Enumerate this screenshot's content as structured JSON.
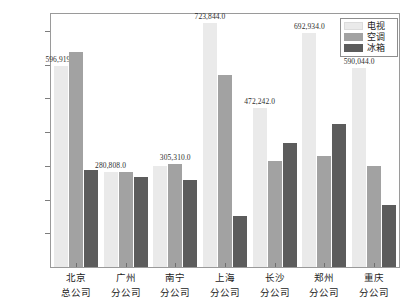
{
  "chart_data": {
    "type": "bar",
    "title": "",
    "subtitle": "",
    "xlabel": "",
    "ylabel": "",
    "ylim": [
      0,
      750000
    ],
    "ytick_values": [
      0,
      100000,
      200000,
      300000,
      400000,
      500000,
      600000,
      700000
    ],
    "ytick_labels": [
      "0",
      "100 000",
      "200 000",
      "300 000",
      "400 000",
      "500 000",
      "600 000",
      "700 000"
    ],
    "grid": false,
    "legend_position": "top-right",
    "categories": [
      "北京\n总公司",
      "广州\n分公司",
      "南宁\n分公司",
      "上海\n分公司",
      "长沙\n分公司",
      "郑州\n分公司",
      "重庆\n分公司"
    ],
    "category_lines": [
      [
        "北京",
        "总公司"
      ],
      [
        "广州",
        "分公司"
      ],
      [
        "南宁",
        "分公司"
      ],
      [
        "上海",
        "分公司"
      ],
      [
        "长沙",
        "分公司"
      ],
      [
        "郑州",
        "分公司"
      ],
      [
        "重庆",
        "分公司"
      ]
    ],
    "series": [
      {
        "name": "电视",
        "color": "#eaeaea",
        "values": [
          596919,
          280808,
          298000,
          723844,
          472242,
          692934,
          590044
        ]
      },
      {
        "name": "空调",
        "color": "#a2a2a2",
        "values": [
          637000,
          282000,
          305310,
          570000,
          314000,
          330000,
          298000
        ]
      },
      {
        "name": "冰箱",
        "color": "#5c5c5c",
        "values": [
          288000,
          268000,
          257000,
          152000,
          367000,
          424000,
          183000
        ]
      }
    ],
    "data_labels": [
      {
        "text": "596,919.0",
        "category": "北京总公司",
        "series": "电视",
        "value": 596919
      },
      {
        "text": "280,808.0",
        "category": "广州分公司",
        "series": "电视",
        "value": 280808
      },
      {
        "text": "305,310.0",
        "category": "南宁分公司",
        "series": "空调",
        "value": 305310
      },
      {
        "text": "723,844.0",
        "category": "上海分公司",
        "series": "电视",
        "value": 723844
      },
      {
        "text": "472,242.0",
        "category": "长沙分公司",
        "series": "电视",
        "value": 472242
      },
      {
        "text": "692,934.0",
        "category": "郑州分公司",
        "series": "电视",
        "value": 692934
      },
      {
        "text": "590,044.0",
        "category": "重庆分公司",
        "series": "电视",
        "value": 590044
      }
    ],
    "legend_entries": [
      {
        "label": "电视",
        "color": "#eaeaea"
      },
      {
        "label": "空调",
        "color": "#a2a2a2"
      },
      {
        "label": "冰箱",
        "color": "#5c5c5c"
      }
    ]
  }
}
